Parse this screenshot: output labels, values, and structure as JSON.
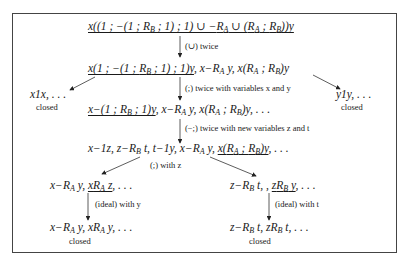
{
  "diagram": {
    "root": {
      "formula_underlined": "x((1 ; −(1 ; R_B ; 1) ; 1) ∪ −R_A ∪ (R_A ; R_B))y"
    },
    "step1": {
      "rule_label": "(∪) twice",
      "formula_underlined": "x(1 ; −(1 ; R_B ; 1) ; 1)y",
      "formula_rest": ", x−R_A y, x(R_A ; R_B)y"
    },
    "step2": {
      "rule_label": "(;) twice with variables x and y",
      "formula_underlined": "x−(1 ; R_B ; 1)y",
      "formula_rest": ", x−R_A y, x(R_A ; R_B)y, . . ."
    },
    "left_branch": {
      "formula": "x1x, . . .",
      "status": "closed"
    },
    "right_branch": {
      "formula": "y1y, . . .",
      "status": "closed"
    },
    "step3": {
      "rule_label": "(−;) twice with new variables z and t",
      "formula_prefix": "x−1z, z−R_B t, t−1y, x−R_A y, ",
      "formula_underlined": "x(R_A ; R_B)y",
      "formula_suffix": ", . . ."
    },
    "split_label": "(;) with z",
    "left_leaf": {
      "formula_prefix": "x−R_A y, ",
      "formula_underlined": "xR_A z",
      "formula_suffix": ", . . .",
      "rule_label": "(ideal) with y",
      "result": "x−R_A y, xR_A y, . . .",
      "status": "closed"
    },
    "right_leaf": {
      "formula_prefix": "z−R_B t, , ",
      "formula_underlined": "zR_B y",
      "formula_suffix": ", . . .",
      "rule_label": "(ideal) with t",
      "result": "z−R_B t, zR_B t, . . .",
      "status": "closed"
    },
    "colors": {
      "stroke": "#333333",
      "text": "#1a1a1a",
      "frame": "#444444"
    }
  }
}
